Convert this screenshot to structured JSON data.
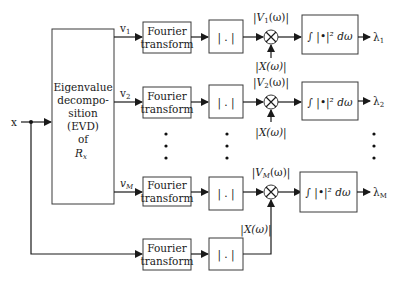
{
  "diagram": {
    "input_label": "x",
    "evd_block": {
      "lines": [
        "Eigenvalue",
        "decompo-",
        "sition",
        "(EVD)",
        "of",
        "R"
      ],
      "matrix_subscript": "x"
    },
    "channels": [
      {
        "eigvec": "v",
        "eigvec_sub": "1",
        "fourier": [
          "Fourier",
          "transform"
        ],
        "abs": "| . |",
        "mag_label": "|V",
        "mag_sub": "1",
        "mag_tail": "(ω)|",
        "x_label": "|X(ω)|",
        "integral": "∫ |•|² dω",
        "out": "λ",
        "out_sub": "1"
      },
      {
        "eigvec": "v",
        "eigvec_sub": "2",
        "fourier": [
          "Fourier",
          "transform"
        ],
        "abs": "| . |",
        "mag_label": "|V",
        "mag_sub": "2",
        "mag_tail": "(ω)|",
        "x_label": "|X(ω)|",
        "integral": "∫ |•|² dω",
        "out": "λ",
        "out_sub": "2"
      },
      {
        "eigvec": "v",
        "eigvec_sub": "M",
        "fourier": [
          "Fourier",
          "transform"
        ],
        "abs": "| . |",
        "mag_label": "|V",
        "mag_sub": "M",
        "mag_tail": "(ω)|",
        "x_label": "|X(ω)|",
        "integral": "∫ |•|² dω",
        "out": "λ",
        "out_sub": "M"
      }
    ],
    "reference_path": {
      "fourier": [
        "Fourier",
        "transform"
      ],
      "abs": "| . |"
    },
    "multiplier_symbol": "×",
    "colors": {
      "line": "#1a1a1a",
      "box_border": "#3a3a3a",
      "background": "#ffffff"
    }
  }
}
